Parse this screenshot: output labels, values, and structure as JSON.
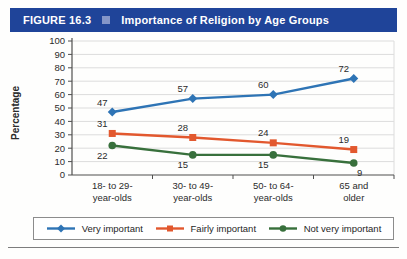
{
  "figure": {
    "label": "FIGURE 16.3",
    "title": "Importance of Religion by Age Groups",
    "header_bg": "#1f4499",
    "header_square_color": "#8496c8"
  },
  "chart_data": {
    "type": "line",
    "title": "Importance of Religion by Age Groups",
    "xlabel": "",
    "ylabel": "Percentage",
    "ylim": [
      0,
      100
    ],
    "ytick_step": 10,
    "grid": true,
    "legend_position": "bottom",
    "categories": [
      [
        "18- to 29-",
        "year-olds"
      ],
      [
        "30- to 49-",
        "year-olds"
      ],
      [
        "50- to 64-",
        "year-olds"
      ],
      [
        "65 and",
        "older"
      ]
    ],
    "series": [
      {
        "name": "Very important",
        "values": [
          47,
          57,
          60,
          72
        ],
        "color": "#2e74b5",
        "marker": "diamond",
        "label_side": "above"
      },
      {
        "name": "Fairly important",
        "values": [
          31,
          28,
          24,
          19
        ],
        "color": "#e2582e",
        "marker": "square",
        "label_side": "above"
      },
      {
        "name": "Not very important",
        "values": [
          22,
          15,
          15,
          9
        ],
        "color": "#38703c",
        "marker": "circle",
        "label_side": "below"
      }
    ],
    "axis_color": "#4f4f4f",
    "gridline_color": "#dcdcdc"
  }
}
